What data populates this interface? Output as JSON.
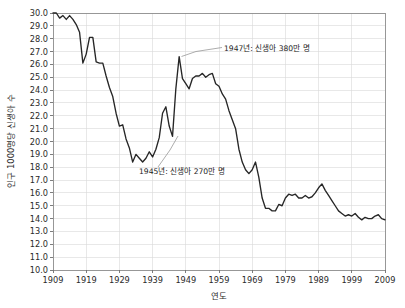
{
  "chart_data": {
    "type": "line",
    "title": "",
    "xlabel": "연도",
    "ylabel": "인구 1000명당 신생아 수",
    "xlim": [
      1909,
      2009
    ],
    "ylim": [
      10.0,
      30.0
    ],
    "grid": true,
    "legend": "none",
    "x_ticks": [
      "1909",
      "1919",
      "1929",
      "1939",
      "1949",
      "1959",
      "1969",
      "1979",
      "1989",
      "1999",
      "2009"
    ],
    "y_ticks": [
      "10.0",
      "11.0",
      "12.0",
      "13.0",
      "14.0",
      "15.0",
      "16.0",
      "17.0",
      "18.0",
      "19.0",
      "20.0",
      "21.0",
      "22.0",
      "23.0",
      "24.0",
      "25.0",
      "26.0",
      "27.0",
      "28.0",
      "29.0",
      "30.0"
    ],
    "series": [
      {
        "name": "인구 1000명당 신생아 수",
        "color": "#262626",
        "x": [
          1909,
          1910,
          1911,
          1912,
          1913,
          1914,
          1915,
          1916,
          1917,
          1918,
          1919,
          1920,
          1921,
          1922,
          1923,
          1924,
          1925,
          1926,
          1927,
          1928,
          1929,
          1930,
          1931,
          1932,
          1933,
          1934,
          1935,
          1936,
          1937,
          1938,
          1939,
          1940,
          1941,
          1942,
          1943,
          1944,
          1945,
          1946,
          1947,
          1948,
          1949,
          1950,
          1951,
          1952,
          1953,
          1954,
          1955,
          1956,
          1957,
          1958,
          1959,
          1960,
          1961,
          1962,
          1963,
          1964,
          1965,
          1966,
          1967,
          1968,
          1969,
          1970,
          1971,
          1972,
          1973,
          1974,
          1975,
          1976,
          1977,
          1978,
          1979,
          1980,
          1981,
          1982,
          1983,
          1984,
          1985,
          1986,
          1987,
          1988,
          1989,
          1990,
          1991,
          1992,
          1993,
          1994,
          1995,
          1996,
          1997,
          1998,
          1999,
          2000,
          2001,
          2002,
          2003,
          2004,
          2005,
          2006,
          2007,
          2008,
          2009
        ],
        "values": [
          30.0,
          30.0,
          29.6,
          29.8,
          29.5,
          29.8,
          29.5,
          29.1,
          28.5,
          26.1,
          26.8,
          28.1,
          28.1,
          26.2,
          26.1,
          26.1,
          25.1,
          24.2,
          23.5,
          22.2,
          21.2,
          21.3,
          20.2,
          19.5,
          18.4,
          19.0,
          18.7,
          18.4,
          18.7,
          19.2,
          18.8,
          19.4,
          20.3,
          22.2,
          22.7,
          21.2,
          20.4,
          24.1,
          26.6,
          24.9,
          24.5,
          24.1,
          24.9,
          25.1,
          25.1,
          25.3,
          25.0,
          25.2,
          25.3,
          24.5,
          24.3,
          23.7,
          23.3,
          22.4,
          21.7,
          21.0,
          19.4,
          18.4,
          17.8,
          17.5,
          17.8,
          18.4,
          17.2,
          15.6,
          14.8,
          14.8,
          14.6,
          14.6,
          15.1,
          15.0,
          15.6,
          15.9,
          15.8,
          15.9,
          15.6,
          15.6,
          15.8,
          15.6,
          15.7,
          16.0,
          16.4,
          16.7,
          16.2,
          15.8,
          15.4,
          15.0,
          14.6,
          14.4,
          14.2,
          14.3,
          14.2,
          14.4,
          14.1,
          13.9,
          14.1,
          14.0,
          14.0,
          14.2,
          14.3,
          14.0,
          13.9
        ]
      }
    ],
    "annotations": [
      {
        "id": "annotation-1947",
        "label": "1947년: 신생아 380만 명",
        "point_year": 1947,
        "point_value": 26.6
      },
      {
        "id": "annotation-1945",
        "label": "1945년: 신생아 270만 명",
        "point_year": 1945,
        "point_value": 20.4
      }
    ]
  }
}
